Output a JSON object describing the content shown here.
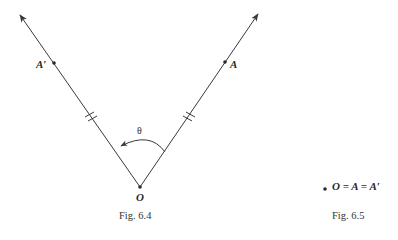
{
  "figures": [
    {
      "caption": "Fig. 6.4",
      "vertex_label": "O",
      "left_point_label": "A′",
      "right_point_label": "A",
      "angle_label": "θ"
    },
    {
      "caption": "Fig. 6.5",
      "equation": "O = A = A′"
    }
  ],
  "colors": {
    "line": "#3a3a3a",
    "text": "#2a2a2a",
    "background": "#ffffff"
  }
}
